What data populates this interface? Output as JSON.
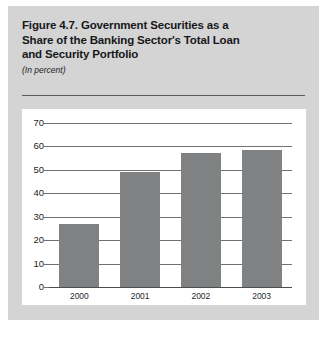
{
  "figure": {
    "title_lines": [
      "Figure 4.7.  Government Securities as a",
      "Share of the Banking Sector's Total Loan",
      "and Security Portfolio"
    ],
    "subtitle": "(In percent)"
  },
  "colors": {
    "panel_background": "#d4d4d4",
    "plot_background": "#ffffff",
    "bar_fill": "#7f8183",
    "gridline": "#6f7174",
    "text": "#1d1e20"
  },
  "chart_data": {
    "type": "bar",
    "title": "Figure 4.7.  Government Securities as a Share of the Banking Sector's Total Loan and Security Portfolio",
    "subtitle": "(In percent)",
    "xlabel": "",
    "ylabel": "",
    "categories": [
      "2000",
      "2001",
      "2002",
      "2003"
    ],
    "values": [
      27,
      49,
      57,
      58.5
    ],
    "ylim": [
      0,
      70
    ],
    "yticks": [
      0,
      10,
      20,
      30,
      40,
      50,
      60,
      70
    ],
    "ytick_labels": [
      "0",
      "10",
      "20",
      "30",
      "40",
      "50",
      "60",
      "70"
    ],
    "grid": true,
    "grid_axis": "y",
    "legend": false,
    "legend_position": "none"
  }
}
